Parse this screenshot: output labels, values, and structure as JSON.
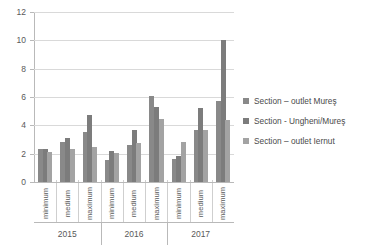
{
  "chart_data": {
    "type": "bar",
    "title": "",
    "xlabel": "",
    "ylabel": "",
    "ylim": [
      0,
      12
    ],
    "yticks": [
      0,
      2,
      4,
      6,
      8,
      10,
      12
    ],
    "grid": true,
    "legend_position": "right",
    "categories": [
      "minimum",
      "medium",
      "maximum",
      "minimum",
      "medium",
      "maximum",
      "minimum",
      "medium",
      "maximum"
    ],
    "group_labels": [
      "2015",
      "2016",
      "2017"
    ],
    "groups_per_label": 3,
    "series": [
      {
        "name": "Section – outlet Mureş",
        "color": "#898989",
        "values": [
          2.3,
          2.85,
          3.5,
          1.55,
          2.6,
          6.05,
          1.6,
          3.65,
          5.7
        ]
      },
      {
        "name": "Section - Ungheni/Mureş",
        "color": "#7c7c7c",
        "values": [
          2.3,
          3.1,
          4.7,
          2.2,
          3.7,
          5.3,
          1.85,
          5.2,
          10.05
        ]
      },
      {
        "name": "Section – outlet Iernut",
        "color": "#a3a3a3",
        "values": [
          2.1,
          2.3,
          2.5,
          2.05,
          2.75,
          4.45,
          2.8,
          3.65,
          4.35
        ]
      }
    ]
  },
  "legend": {
    "items": [
      {
        "label": "Section – outlet Mureş"
      },
      {
        "label": "Section - Ungheni/Mureş"
      },
      {
        "label": "Section – outlet Iernut"
      }
    ]
  },
  "axis": {
    "y_tick_labels": [
      "12",
      "10",
      "8",
      "6",
      "4",
      "2",
      "0"
    ]
  }
}
